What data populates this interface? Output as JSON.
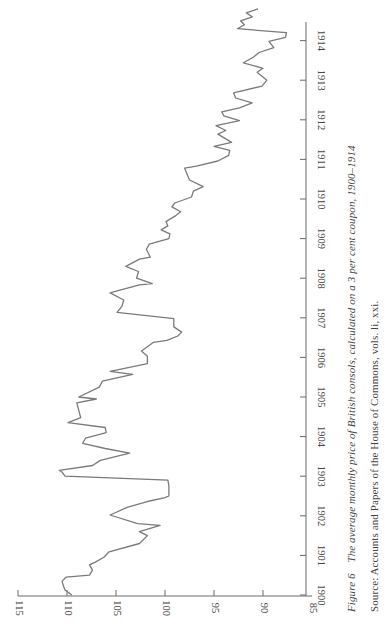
{
  "figure": {
    "label": "Figure 6",
    "title": "The average monthly price of British consols, calculated on a 3 per cent coupon, 1900–1914",
    "source": "Source: Accounts and Papers of the House of Commons, vols. li, xxi.",
    "orientation": "rotated 90° counter-clockwise"
  },
  "chart_data": {
    "type": "line",
    "title": "The average monthly price of British consols, calculated on a 3 per cent coupon, 1900–1914",
    "xlabel": "",
    "ylabel": "",
    "x_ticks": [
      "1900",
      "1901",
      "1902",
      "1903",
      "1904",
      "1905",
      "1906",
      "1907",
      "1908",
      "1909",
      "1910",
      "1911",
      "1912",
      "1913",
      "1914"
    ],
    "y_ticks": [
      85,
      90,
      95,
      100,
      105,
      110,
      115
    ],
    "xlim": [
      1900,
      1914.8
    ],
    "ylim": [
      85,
      115
    ],
    "grid": false,
    "legend": null,
    "series": [
      {
        "name": "Consol price",
        "color": "#7a7a7a",
        "x": [
          1900.0,
          1900.13,
          1900.25,
          1900.35,
          1900.45,
          1900.5,
          1900.63,
          1900.76,
          1900.83,
          1900.96,
          1901.09,
          1901.3,
          1901.5,
          1901.6,
          1901.76,
          1901.8,
          1902.02,
          1902.22,
          1902.36,
          1902.46,
          1902.5,
          1902.75,
          1902.9,
          1903.0,
          1903.1,
          1903.15,
          1903.27,
          1903.4,
          1903.58,
          1903.7,
          1903.83,
          1903.96,
          1904.1,
          1904.23,
          1904.35,
          1904.48,
          1904.85,
          1904.95,
          1905.0,
          1905.25,
          1905.4,
          1905.57,
          1905.65,
          1905.84,
          1906.03,
          1906.16,
          1906.38,
          1906.43,
          1906.54,
          1906.64,
          1906.77,
          1906.98,
          1907.14,
          1907.29,
          1907.45,
          1907.63,
          1907.7,
          1907.83,
          1907.86,
          1908.0,
          1908.17,
          1908.3,
          1908.48,
          1908.53,
          1908.73,
          1908.86,
          1909.0,
          1909.12,
          1909.22,
          1909.32,
          1909.43,
          1909.58,
          1909.68,
          1909.8,
          1909.9,
          1910.05,
          1910.2,
          1910.31,
          1910.48,
          1910.6,
          1910.78,
          1910.83,
          1910.96,
          1911.1,
          1911.23,
          1911.33,
          1911.43,
          1911.64,
          1911.73,
          1911.85,
          1911.98,
          1912.1,
          1912.2,
          1912.3,
          1912.43,
          1912.55,
          1912.68,
          1912.85,
          1913.0,
          1913.2,
          1913.3,
          1913.44,
          1913.58,
          1913.7,
          1913.82,
          1913.98,
          1914.08,
          1914.2,
          1914.3,
          1914.4,
          1914.5,
          1914.6,
          1914.7,
          1914.8
        ],
        "values": [
          109.5,
          110.2,
          110.4,
          110.5,
          110.1,
          107.7,
          107.4,
          107.7,
          107.1,
          106.2,
          105.7,
          102.6,
          101.8,
          102.6,
          100.5,
          102.8,
          105.6,
          103.8,
          101.8,
          100.0,
          99.6,
          99.6,
          99.7,
          110.2,
          110.5,
          110.8,
          107.4,
          106.6,
          103.6,
          106.1,
          108.4,
          108.1,
          106.0,
          106.1,
          109.9,
          108.6,
          109.0,
          107.0,
          108.8,
          106.7,
          106.4,
          103.3,
          105.6,
          101.8,
          101.8,
          102.4,
          101.2,
          99.8,
          98.7,
          98.3,
          99.1,
          99.1,
          104.9,
          104.4,
          104.2,
          105.6,
          104.6,
          102.6,
          101.3,
          102.9,
          102.7,
          104.0,
          102.6,
          101.5,
          101.9,
          101.6,
          99.6,
          99.5,
          100.4,
          99.7,
          99.9,
          98.9,
          98.4,
          99.3,
          99.0,
          97.3,
          97.1,
          96.1,
          97.5,
          97.7,
          98.0,
          96.8,
          94.6,
          93.5,
          93.4,
          95.0,
          93.2,
          94.6,
          93.8,
          94.8,
          92.4,
          94.0,
          94.2,
          92.4,
          91.1,
          92.8,
          93.0,
          90.1,
          89.6,
          90.6,
          90.0,
          92.0,
          91.0,
          90.4,
          88.9,
          89.4,
          87.7,
          87.6,
          92.6,
          91.9,
          92.3,
          91.1,
          91.7,
          90.5
        ]
      }
    ]
  }
}
